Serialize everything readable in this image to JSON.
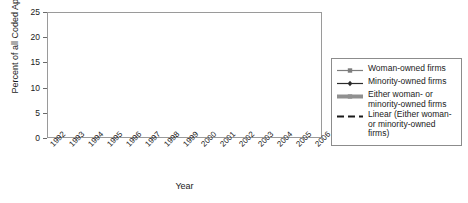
{
  "chart_data": {
    "type": "line",
    "title": "",
    "xlabel": "Year",
    "ylabel": "Percent of all Coded Applications",
    "categories": [
      1992,
      1993,
      1994,
      1995,
      1996,
      1997,
      1998,
      1999,
      2000,
      2001,
      2002,
      2003,
      2004,
      2005,
      2006
    ],
    "ylim": [
      0,
      25
    ],
    "yticks": [
      0,
      5,
      10,
      15,
      20,
      25
    ],
    "grid": true,
    "legend_position": "right",
    "series": [
      {
        "name": "Woman-owned firms",
        "marker": "square",
        "color": "#7d7d7d",
        "line_width": 1,
        "values": [
          12.3,
          8.1,
          9.6,
          12.7,
          11.8,
          10.1,
          8.2,
          10.8,
          9.7,
          4.4,
          2.3,
          10.8,
          11.1,
          10.3,
          12.6
        ]
      },
      {
        "name": "Minority-owned firms",
        "marker": "diamond",
        "color": "#2b2b2b",
        "line_width": 1,
        "values": [
          10.2,
          6.9,
          9.5,
          9.3,
          10.1,
          8.6,
          5.4,
          7.7,
          5.2,
          2.6,
          0.9,
          6.7,
          6.9,
          4.9,
          6.4
        ]
      },
      {
        "name": "Either woman- or minority-owned firms",
        "marker": "square",
        "color": "#909090",
        "line_width": 4,
        "values": [
          21.5,
          14.1,
          17.6,
          20.9,
          19.9,
          16.4,
          14.2,
          18.4,
          15.1,
          6.9,
          2.2,
          17.1,
          17.2,
          14.7,
          17.7
        ]
      },
      {
        "name": "Linear (Either woman- or minority-owned firms)",
        "marker": "none",
        "style": "dashed",
        "color": "#1a1a1a",
        "line_width": 1.6,
        "endpoints": [
          18.3,
          13.2
        ]
      }
    ]
  },
  "axes": {
    "y_tick_labels": [
      "0",
      "5",
      "10",
      "15",
      "20",
      "25"
    ],
    "x_tick_labels": [
      "1992",
      "1993",
      "1994",
      "1995",
      "1996",
      "1997",
      "1998",
      "1999",
      "2000",
      "2001",
      "2002",
      "2003",
      "2004",
      "2005",
      "2006"
    ],
    "y_axis_title": "Percent of all Coded Applications",
    "x_axis_title": "Year"
  },
  "legend": {
    "items": [
      {
        "label": "Woman-owned firms",
        "key": "square-line-marker"
      },
      {
        "label": "Minority-owned firms",
        "key": "diamond-line-marker"
      },
      {
        "label": "Either woman- or minority-owned firms",
        "key": "thick-line-marker"
      },
      {
        "label": "Linear (Either woman- or minority-owned firms)",
        "key": "dashed-line-marker"
      }
    ]
  }
}
